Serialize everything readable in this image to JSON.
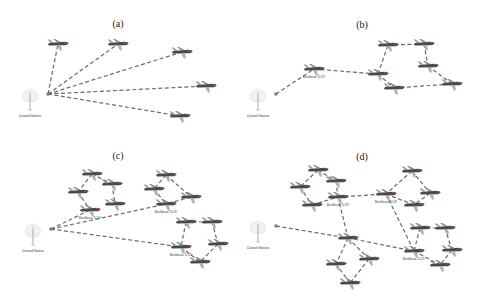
{
  "figure": {
    "panels": [
      {
        "id": "a",
        "title": "(a)",
        "ground_station_label": "Ground Station",
        "backbone_labels": [],
        "ground": [
          30,
          100
        ],
        "planes": [
          [
            58,
            44
          ],
          [
            118,
            44
          ],
          [
            182,
            52
          ],
          [
            206,
            86
          ],
          [
            180,
            116
          ]
        ],
        "links": [
          [
            -1,
            0
          ],
          [
            -1,
            1
          ],
          [
            -1,
            2
          ],
          [
            -1,
            3
          ],
          [
            -1,
            4
          ]
        ]
      },
      {
        "id": "b",
        "title": "(b)",
        "ground_station_label": "Ground Station",
        "backbone_labels": [
          "Backbone UAV"
        ],
        "ground": [
          258,
          100
        ],
        "planes": [
          [
            314,
            69
          ],
          [
            388,
            45
          ],
          [
            424,
            44
          ],
          [
            378,
            74
          ],
          [
            428,
            66
          ],
          [
            394,
            88
          ],
          [
            452,
            84
          ]
        ],
        "backbone_idx": [
          0
        ],
        "links": [
          [
            -1,
            0
          ],
          [
            0,
            3
          ],
          [
            3,
            1
          ],
          [
            1,
            2
          ],
          [
            2,
            4
          ],
          [
            4,
            6
          ],
          [
            3,
            5
          ],
          [
            5,
            6
          ]
        ]
      },
      {
        "id": "c",
        "title": "(c)",
        "ground_station_label": "Ground Station",
        "backbone_labels": [
          "Backbone UAV",
          "Backbone UAV",
          "Backbone UAV"
        ],
        "ground": [
          33,
          235
        ],
        "planes": [
          [
            92,
            174
          ],
          [
            78,
            192
          ],
          [
            112,
            184
          ],
          [
            90,
            210
          ],
          [
            115,
            204
          ],
          [
            166,
            175
          ],
          [
            154,
            189
          ],
          [
            191,
            197
          ],
          [
            166,
            204
          ],
          [
            186,
            222
          ],
          [
            212,
            222
          ],
          [
            218,
            244
          ],
          [
            181,
            247
          ],
          [
            200,
            262
          ]
        ],
        "backbone_idx": [
          3,
          8,
          12
        ],
        "links": [
          [
            -1,
            3
          ],
          [
            -1,
            8
          ],
          [
            -1,
            12
          ],
          [
            0,
            1
          ],
          [
            0,
            2
          ],
          [
            1,
            3
          ],
          [
            2,
            4
          ],
          [
            5,
            6
          ],
          [
            5,
            7
          ],
          [
            6,
            8
          ],
          [
            7,
            8
          ],
          [
            9,
            12
          ],
          [
            10,
            11
          ],
          [
            11,
            13
          ],
          [
            12,
            13
          ],
          [
            9,
            10
          ]
        ]
      },
      {
        "id": "d",
        "title": "(d)",
        "ground_station_label": "Ground Station",
        "backbone_labels": [
          "Backbone UAV",
          "Backbone UAV",
          "Backbone UAV"
        ],
        "ground": [
          258,
          232
        ],
        "planes": [
          [
            318,
            170
          ],
          [
            300,
            187
          ],
          [
            336,
            181
          ],
          [
            312,
            205
          ],
          [
            338,
            197
          ],
          [
            412,
            171
          ],
          [
            386,
            194
          ],
          [
            430,
            193
          ],
          [
            414,
            205
          ],
          [
            420,
            228
          ],
          [
            445,
            228
          ],
          [
            452,
            250
          ],
          [
            414,
            251
          ],
          [
            440,
            265
          ],
          [
            348,
            238
          ],
          [
            336,
            264
          ],
          [
            369,
            259
          ],
          [
            350,
            283
          ]
        ],
        "backbone_idx": [
          4,
          6,
          12
        ],
        "links": [
          [
            -1,
            14
          ],
          [
            0,
            1
          ],
          [
            0,
            2
          ],
          [
            1,
            3
          ],
          [
            2,
            4
          ],
          [
            3,
            4
          ],
          [
            4,
            6
          ],
          [
            5,
            6
          ],
          [
            5,
            7
          ],
          [
            6,
            8
          ],
          [
            7,
            8
          ],
          [
            6,
            12
          ],
          [
            4,
            14
          ],
          [
            14,
            12
          ],
          [
            9,
            12
          ],
          [
            9,
            10
          ],
          [
            10,
            11
          ],
          [
            11,
            13
          ],
          [
            12,
            13
          ],
          [
            14,
            15
          ],
          [
            14,
            16
          ],
          [
            15,
            17
          ],
          [
            16,
            17
          ]
        ]
      }
    ]
  }
}
